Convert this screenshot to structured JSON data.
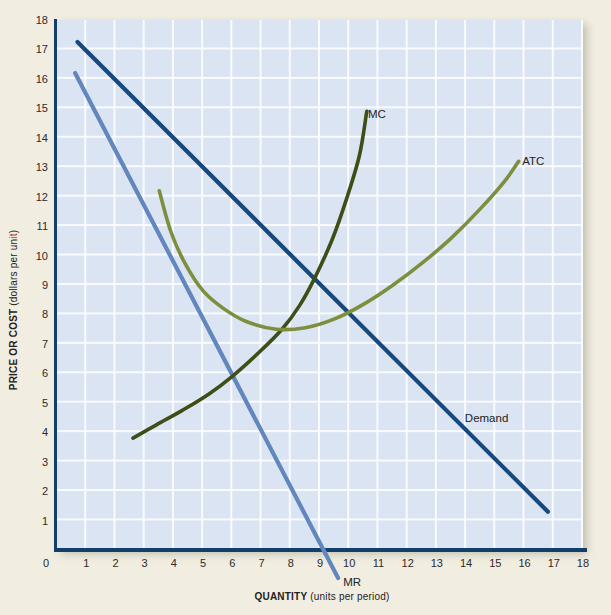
{
  "figure": {
    "page_bg": "#f1ede0",
    "plot_bg": "#dbe4f3",
    "grid_color": "#ffffff",
    "axis_color": "#123e6b",
    "red_accent": "#b03a2e",
    "tick_color": "#2b2b2b"
  },
  "x_axis": {
    "title_bold": "QUANTITY",
    "title_rest": "(units per period)",
    "ticks": [
      0,
      1,
      2,
      3,
      4,
      5,
      6,
      7,
      8,
      9,
      10,
      11,
      12,
      13,
      14,
      15,
      16,
      17,
      18
    ]
  },
  "y_axis": {
    "title_bold": "PRICE OR COST",
    "title_paren_prefix": "(dollars per un",
    "title_paren_red": "it",
    "title_paren_suffix": ")",
    "ticks": [
      1,
      2,
      3,
      4,
      5,
      6,
      7,
      8,
      9,
      10,
      11,
      12,
      13,
      14,
      15,
      16,
      17,
      18
    ]
  },
  "chart_data": {
    "type": "line",
    "title": "",
    "xlabel": "QUANTITY (units per period)",
    "ylabel": "PRICE OR COST (dollars per unit)",
    "xlim": [
      0,
      18
    ],
    "ylim": [
      0,
      18
    ],
    "grid": true,
    "legend_position": "inline-labels",
    "series": [
      {
        "name": "Demand",
        "color": "#17497c",
        "width": 4.2,
        "smooth": false,
        "points": [
          [
            0.7,
            17.25
          ],
          [
            16.8,
            1.3
          ]
        ]
      },
      {
        "name": "MR",
        "color": "#6287bd",
        "width": 4.2,
        "smooth": false,
        "points": [
          [
            0.62,
            16.2
          ],
          [
            9.62,
            -0.95
          ]
        ]
      },
      {
        "name": "MC",
        "color": "#3e4e16",
        "width": 3.6,
        "smooth": true,
        "points": [
          [
            2.6,
            3.8
          ],
          [
            3.4,
            4.25
          ],
          [
            4.3,
            4.75
          ],
          [
            5.2,
            5.3
          ],
          [
            6.0,
            5.9
          ],
          [
            6.9,
            6.7
          ],
          [
            7.7,
            7.5
          ],
          [
            8.3,
            8.3
          ],
          [
            8.8,
            9.2
          ],
          [
            9.4,
            10.5
          ],
          [
            9.9,
            11.9
          ],
          [
            10.35,
            13.4
          ],
          [
            10.6,
            14.9
          ]
        ]
      },
      {
        "name": "ATC",
        "color": "#7d8f3d",
        "width": 3.6,
        "smooth": true,
        "points": [
          [
            3.5,
            12.2
          ],
          [
            3.9,
            10.8
          ],
          [
            4.4,
            9.7
          ],
          [
            5.0,
            8.8
          ],
          [
            5.7,
            8.2
          ],
          [
            6.5,
            7.75
          ],
          [
            7.5,
            7.5
          ],
          [
            8.5,
            7.55
          ],
          [
            9.5,
            7.85
          ],
          [
            10.5,
            8.35
          ],
          [
            11.5,
            9.0
          ],
          [
            12.5,
            9.75
          ],
          [
            13.5,
            10.6
          ],
          [
            14.5,
            11.6
          ],
          [
            15.3,
            12.5
          ],
          [
            15.8,
            13.2
          ]
        ]
      }
    ],
    "annotations": [
      {
        "label": "MC",
        "x": 10.95,
        "y": 14.8
      },
      {
        "label": "ATC",
        "x": 16.3,
        "y": 13.2
      },
      {
        "label": "Demand",
        "x": 14.7,
        "y": 4.5
      },
      {
        "label": "MR",
        "x": 10.1,
        "y": -1.1
      }
    ]
  }
}
